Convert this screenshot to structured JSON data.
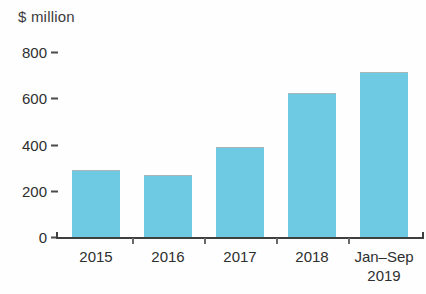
{
  "chart_data": {
    "type": "bar",
    "title": "",
    "subtitle": "",
    "xlabel": "",
    "ylabel": "$ million",
    "categories": [
      "2015",
      "2016",
      "2017",
      "2018",
      "Jan–Sep 2019"
    ],
    "category_lines": [
      [
        "2015"
      ],
      [
        "2016"
      ],
      [
        "2017"
      ],
      [
        "2018"
      ],
      [
        "Jan–Sep",
        "2019"
      ]
    ],
    "values": [
      285,
      265,
      385,
      620,
      710
    ],
    "ylim": [
      0,
      800
    ],
    "yticks": [
      800,
      600,
      400,
      200,
      0
    ],
    "ytick_labels": [
      "800",
      "600",
      "400",
      "200",
      "0"
    ],
    "grid": false,
    "legend": false,
    "legend_position": "none",
    "bar_color": "#6ec9e3",
    "axis_color": "#3f3f3f",
    "text_color": "#2f2f2f"
  },
  "axis": {
    "y_title": "$ million"
  }
}
